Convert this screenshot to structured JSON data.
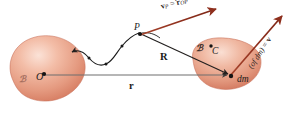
{
  "figure": {
    "background_color": "#ffffff",
    "width": 295,
    "height": 122
  },
  "colors": {
    "blob_fill_light": "#f7cdbd",
    "blob_fill_mid": "#e99d86",
    "blob_fill_deep": "#d4775c",
    "blob_edge": "#c8705a",
    "arrow_red": "#8e2f1d",
    "arrow_red_light": "#b4533a",
    "line_gray": "#6f6f6f",
    "path_black": "#1b1b1b",
    "text": "#1b1b1b"
  },
  "bodies": [
    {
      "id": "reference-body",
      "label": "ℬ",
      "label_desc": "script-B-reference-frame",
      "point_label": "O",
      "point_desc": "origin"
    },
    {
      "id": "rigid-body",
      "label": "ℬ",
      "label_desc": "script-B-body",
      "center_label": "C",
      "element_label": "dm"
    }
  ],
  "points": {
    "origin": "O",
    "point_p": "P",
    "center_of_mass": "C",
    "mass_element": "dm"
  },
  "vectors": {
    "r_label": "r",
    "r_desc": "position-vector-O-to-dm",
    "R_label": "R",
    "R_desc": "position-vector-P-to-dm"
  },
  "equations": {
    "velocity_p": {
      "lhs_vec": "v",
      "lhs_sub": "P",
      "equals": "=",
      "rhs_vec": "r",
      "rhs_sub": "OP",
      "plain": "v_P = ṙ_OP"
    },
    "velocity_dm": {
      "prefix": "(of dm)",
      "equals": "=",
      "lhs_vec": "v",
      "plain": "v (of dm) ="
    }
  },
  "path": {
    "label_desc": "wavy-trajectory-of-point-P"
  }
}
